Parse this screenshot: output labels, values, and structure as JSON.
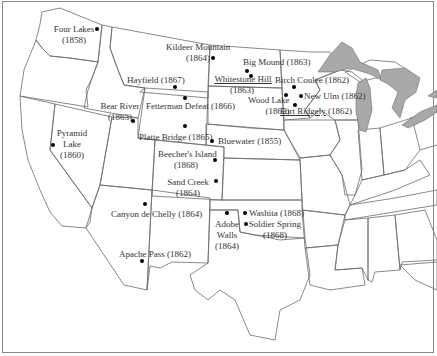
{
  "map": {
    "title": "",
    "region": "Western and Central United States",
    "colors": {
      "land": "#ffffff",
      "borders": "#6b6b6b",
      "great_lakes": "#a9a9a9",
      "markers": "#000000",
      "text": "#333333"
    },
    "battles": [
      {
        "id": "four-lakes",
        "name": "Four Lakes",
        "year": "(1858)",
        "label": "Four Lakes (1858)"
      },
      {
        "id": "kildeer-mountain",
        "name": "Kildeer Mountain",
        "year": "(1864)",
        "label": "Kildeer Mountain (1864)"
      },
      {
        "id": "big-mound",
        "name": "Big Mound",
        "year": "(1863)",
        "label": "Big Mound (1863)"
      },
      {
        "id": "whitestone-hill",
        "name": "Whitestone Hill",
        "year": "(1863)",
        "label": "Whitestone Hill (1863)"
      },
      {
        "id": "birch-coulee",
        "name": "Birch Coulee",
        "year": "(1862)",
        "label": "Birch Coulee (1862)"
      },
      {
        "id": "new-ulm",
        "name": "New Ulm",
        "year": "(1862)",
        "label": "New Ulm (1862)"
      },
      {
        "id": "wood-lake",
        "name": "Wood Lake",
        "year": "(1862)",
        "label": "Wood Lake (1862)"
      },
      {
        "id": "fort-ridgely",
        "name": "Fort Ridgely",
        "year": "(1862)",
        "label": "Fort Ridgely (1862)"
      },
      {
        "id": "hayfield",
        "name": "Hayfield",
        "year": "(1867)",
        "label": "Hayfield (1867)"
      },
      {
        "id": "fetterman-defeat",
        "name": "Fetterman Defeat",
        "year": "(1866)",
        "label": "Fetterman Defeat (1866)"
      },
      {
        "id": "bear-river",
        "name": "Bear River",
        "year": "(1863)",
        "label": "Bear River (1863)"
      },
      {
        "id": "platte-bridge",
        "name": "Platte Bridge",
        "year": "(1865)",
        "label": "Platte Bridge (1865)"
      },
      {
        "id": "bluewater",
        "name": "Bluewater",
        "year": "(1855)",
        "label": "Bluewater (1855)"
      },
      {
        "id": "pyramid-lake",
        "name": "Pyramid Lake",
        "year": "(1860)",
        "label": "Pyramid Lake (1860)"
      },
      {
        "id": "beechers-island",
        "name": "Beecher's Island",
        "year": "(1868)",
        "label": "Beecher's Island (1868)"
      },
      {
        "id": "sand-creek",
        "name": "Sand Creek",
        "year": "(1864)",
        "label": "Sand Creek (1864)"
      },
      {
        "id": "canyon-de-chelly",
        "name": "Canyon de Chelly",
        "year": "(1864)",
        "label": "Canyon de Chelly (1864)"
      },
      {
        "id": "apache-pass",
        "name": "Apache Pass",
        "year": "(1862)",
        "label": "Apache Pass (1862)"
      },
      {
        "id": "adobe-walls",
        "name": "Adobe Walls",
        "year": "(1864)",
        "label": "Adobe Walls (1864)"
      },
      {
        "id": "washita",
        "name": "Washita",
        "year": "(1868)",
        "label": "Washita (1868)"
      },
      {
        "id": "soldier-spring",
        "name": "Soldier Spring",
        "year": "(1868)",
        "label": "Soldier Spring (1868)"
      }
    ],
    "text": {
      "four_lakes_1": "Four Lakes",
      "four_lakes_2": "(1858)",
      "kildeer_1": "Kildeer Mountain",
      "kildeer_2": "(1864)",
      "big_mound": "Big Mound (1863)",
      "whitestone_1": "Whitestone Hill",
      "whitestone_2": "(1863)",
      "birch_coulee": "Birch Coulee (1862)",
      "new_ulm": "New Ulm (1862)",
      "wood_lake_1": "Wood Lake",
      "wood_lake_2": "(1862)",
      "fort_ridgely_name": "Fort Ridgely",
      "fort_ridgely_year": " (1862)",
      "hayfield": "Hayfield (1867)",
      "fetterman": "Fetterman Defeat (1866)",
      "bear_river_1": "Bear River",
      "bear_river_2": "(1863)",
      "platte_bridge": "Platte Bridge (1865)",
      "bluewater": "Bluewater (1855)",
      "pyramid_1": "Pyramid",
      "pyramid_2": "Lake",
      "pyramid_3": "(1860)",
      "beecher_1": "Beecher's Island",
      "beecher_2": "(1868)",
      "sand_creek_1": "Sand Creek",
      "sand_creek_2": "(1864)",
      "canyon": "Canyon de Chelly (1864)",
      "apache": "Apache Pass (1862)",
      "adobe_1": "Adobe",
      "adobe_2": "Walls",
      "adobe_3": "(1864)",
      "washita": "Washita (1868)",
      "soldier_1": "Soldier Spring",
      "soldier_2": "(1868)"
    }
  }
}
